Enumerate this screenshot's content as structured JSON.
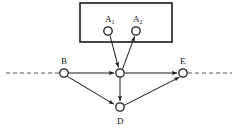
{
  "diagram": {
    "background_color": "#ffffff",
    "stroke_color": "#1a1a1a",
    "node_fill": "#ffffff",
    "node_radius": 4.2,
    "nodes": [
      {
        "id": "A1",
        "label": "A",
        "subscript": "1",
        "x": 108,
        "y": 31,
        "label_x": 105,
        "label_y": 22,
        "sub_x": 111.5,
        "sub_y": 24
      },
      {
        "id": "A2",
        "label": "A",
        "subscript": "2",
        "x": 136,
        "y": 31,
        "label_x": 133,
        "label_y": 22,
        "sub_x": 139.5,
        "sub_y": 24
      },
      {
        "id": "B",
        "label": "B",
        "subscript": "",
        "x": 64,
        "y": 73,
        "label_x": 61,
        "label_y": 64,
        "sub_x": 0,
        "sub_y": 0
      },
      {
        "id": "C",
        "label": "",
        "subscript": "",
        "x": 120,
        "y": 73,
        "label_x": 0,
        "label_y": 0,
        "sub_x": 0,
        "sub_y": 0
      },
      {
        "id": "E",
        "label": "E",
        "subscript": "",
        "x": 183,
        "y": 73,
        "label_x": 180,
        "label_y": 64,
        "sub_x": 0,
        "sub_y": 0
      },
      {
        "id": "D",
        "label": "D",
        "subscript": "",
        "x": 120,
        "y": 107,
        "label_x": 117,
        "label_y": 124,
        "sub_x": 0,
        "sub_y": 0
      }
    ],
    "edges": [
      {
        "id": "A1-to-C",
        "from": "A1",
        "to": "C",
        "arrow": "to",
        "style": "solid"
      },
      {
        "id": "C-to-A2",
        "from": "C",
        "to": "A2",
        "arrow": "to",
        "style": "solid"
      },
      {
        "id": "B-to-C",
        "from": "B",
        "to": "C",
        "arrow": "to",
        "style": "solid"
      },
      {
        "id": "C-to-E",
        "from": "C",
        "to": "E",
        "arrow": "to",
        "style": "solid"
      },
      {
        "id": "B-to-D",
        "from": "B",
        "to": "D",
        "arrow": "to",
        "style": "solid"
      },
      {
        "id": "C-to-D",
        "from": "C",
        "to": "D",
        "arrow": "to",
        "style": "solid"
      },
      {
        "id": "D-to-E",
        "from": "D",
        "to": "E",
        "arrow": "to",
        "style": "solid"
      }
    ],
    "box": {
      "id": "subgraph-box",
      "x": 80,
      "y": 3,
      "width": 92,
      "height": 39,
      "stroke_width": 1.6
    },
    "dashed_line_left": {
      "x1": 6,
      "y1": 73,
      "x2": 59,
      "y2": 73
    },
    "dashed_line_right": {
      "x1": 188,
      "y1": 73,
      "x2": 232,
      "y2": 73
    },
    "dash_pattern": "4,3"
  }
}
